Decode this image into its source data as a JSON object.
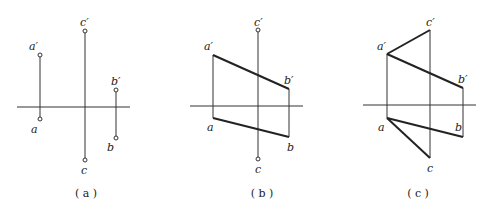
{
  "figure": {
    "panels": [
      {
        "id": "a",
        "caption": "( a )",
        "labels": {
          "a_prime": "a′",
          "a": "a",
          "b_prime": "b′",
          "b": "b",
          "c_prime": "c′",
          "c": "c"
        },
        "description": "Projections of three points A, B, C shown with projection lines to the OX axis"
      },
      {
        "id": "b",
        "caption": "( b )",
        "labels": {
          "a_prime": "a′",
          "a": "a",
          "b_prime": "b′",
          "b": "b",
          "c_prime": "c′",
          "c": "c"
        },
        "description": "Line AB projections a′b′ and ab drawn; point C projections shown"
      },
      {
        "id": "c",
        "caption": "( c )",
        "labels": {
          "a_prime": "a′",
          "a": "a",
          "b_prime": "b′",
          "b": "b",
          "c_prime": "c′",
          "c": "c"
        },
        "description": "Triangle projections: a′b′, a′c′ and ab, ac drawn"
      }
    ]
  }
}
